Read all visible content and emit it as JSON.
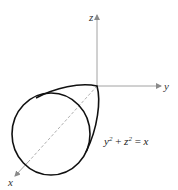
{
  "figure": {
    "axes": {
      "x_label": "x",
      "y_label": "y",
      "z_label": "z"
    },
    "equation": {
      "lhs_term1_base": "y",
      "lhs_term1_exp": "2",
      "plus": " + ",
      "lhs_term2_base": "z",
      "lhs_term2_exp": "2",
      "equals": " = ",
      "rhs": "x"
    },
    "surface": "paraboloid",
    "colors": {
      "curve": "#111111",
      "axis": "#8a8a8a",
      "text": "#333333"
    }
  }
}
